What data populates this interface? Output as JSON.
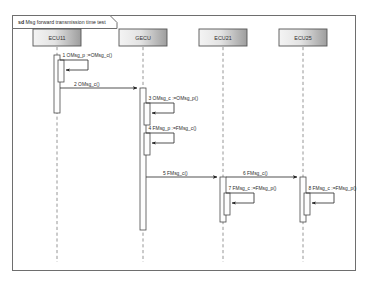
{
  "diagram": {
    "type": "uml-sequence-diagram",
    "frame": {
      "keyword": "sd",
      "title": "Msg forward transmission time test"
    },
    "lifelines": [
      {
        "id": "ecu11",
        "label": "ECU11",
        "x": 57
      },
      {
        "id": "gecu",
        "label": "GECU",
        "x": 143
      },
      {
        "id": "ecu21",
        "label": "ECU21",
        "x": 223
      },
      {
        "id": "ecu25",
        "label": "ECU25",
        "x": 303
      }
    ],
    "messages": [
      {
        "seq": "1",
        "label": "1 OMsg_p :=OMsg_c()",
        "kind": "self",
        "from": "ecu11",
        "to": "ecu11"
      },
      {
        "seq": "2",
        "label": "2 OMsg_c()",
        "kind": "call",
        "from": "ecu11",
        "to": "gecu"
      },
      {
        "seq": "3",
        "label": "3 OMsg_c :=OMsg_p()",
        "kind": "self",
        "from": "gecu",
        "to": "gecu"
      },
      {
        "seq": "4",
        "label": "4 FMsg_p :=FMsg_c()",
        "kind": "self",
        "from": "gecu",
        "to": "gecu"
      },
      {
        "seq": "5",
        "label": "5 FMsg_c()",
        "kind": "call",
        "from": "gecu",
        "to": "ecu21"
      },
      {
        "seq": "6",
        "label": "6 FMsg_c()",
        "kind": "call",
        "from": "ecu21",
        "to": "ecu25"
      },
      {
        "seq": "7",
        "label": "7 FMsg_c :=FMsg_p()",
        "kind": "self",
        "from": "ecu21",
        "to": "ecu21"
      },
      {
        "seq": "8",
        "label": "8 FMsg_c :=FMsg_p()",
        "kind": "self",
        "from": "ecu25",
        "to": "ecu25"
      }
    ],
    "colors": {
      "frame_stroke": "#6e6e6e",
      "head_fill_light": "#f2f2f2",
      "head_fill_dark": "#9a9a9a",
      "lifeline_stroke": "#8b8b8b",
      "message_stroke": "#333333",
      "background": "#ffffff"
    }
  }
}
